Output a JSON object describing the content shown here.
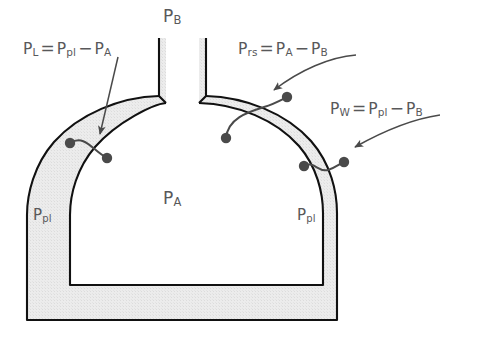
{
  "figure": {
    "title_alt": "Respiratory system pressure relationships",
    "background_color": "#ffffff",
    "shade_color": "#e7e7e7",
    "stroke_color": "#111111",
    "text_color": "#58585a",
    "leader_color": "#4a4a4a",
    "dot_color": "#4a4a4a"
  },
  "labels": {
    "barometric": {
      "id": "P-B",
      "base": "P",
      "sub": "B",
      "x": 163,
      "y": 8
    },
    "alveolar": {
      "id": "P-A",
      "base": "P",
      "sub": "A",
      "x": 163,
      "y": 190
    },
    "pleural_left": {
      "id": "P-pl-left",
      "base": "P",
      "sub": "pl",
      "x": 33,
      "y": 207
    },
    "pleural_right": {
      "id": "P-pl-right",
      "base": "P",
      "sub": "pl",
      "x": 297,
      "y": 207
    }
  },
  "equations": [
    {
      "name": "transpulmonary-pressure",
      "x": 23,
      "y": 40,
      "terms": [
        {
          "base": "P",
          "sub": "L"
        },
        {
          "op": "="
        },
        {
          "base": "P",
          "sub": "pl"
        },
        {
          "op": "−"
        },
        {
          "base": "P",
          "sub": "A"
        }
      ],
      "plain": "PL = Ppl − PA"
    },
    {
      "name": "respiratory-system-pressure",
      "x": 238,
      "y": 40,
      "terms": [
        {
          "base": "P",
          "sub": "rs"
        },
        {
          "op": "="
        },
        {
          "base": "P",
          "sub": "A"
        },
        {
          "op": "−"
        },
        {
          "base": "P",
          "sub": "B"
        }
      ],
      "plain": "Prs = PA − PB"
    },
    {
      "name": "chest-wall-pressure",
      "x": 330,
      "y": 100,
      "terms": [
        {
          "base": "P",
          "sub": "W"
        },
        {
          "op": "="
        },
        {
          "base": "P",
          "sub": "pl"
        },
        {
          "op": "−"
        },
        {
          "base": "P",
          "sub": "B"
        }
      ],
      "plain": "PW = Ppl − PB"
    }
  ],
  "measurement_pairs": [
    {
      "name": "transpulmonary-probe",
      "dot_a": {
        "x": 70,
        "y": 143
      },
      "dot_b": {
        "x": 107,
        "y": 158
      },
      "radius": 5.2
    },
    {
      "name": "respiratory-system-probe",
      "dot_a": {
        "x": 226,
        "y": 138
      },
      "dot_b": {
        "x": 287,
        "y": 97
      },
      "radius": 5.2
    },
    {
      "name": "chest-wall-probe",
      "dot_a": {
        "x": 304,
        "y": 166
      },
      "dot_b": {
        "x": 344,
        "y": 162
      },
      "radius": 5.2
    }
  ],
  "arrow_leaders": [
    {
      "name": "leader-to-transpulmonary",
      "from": {
        "x": 117,
        "y": 57
      },
      "to": {
        "x": 99,
        "y": 138
      }
    },
    {
      "name": "leader-to-respiratory-system",
      "from": {
        "x": 322,
        "y": 57
      },
      "to": {
        "x": 270,
        "y": 94
      }
    },
    {
      "name": "leader-to-chest-wall",
      "from": {
        "x": 425,
        "y": 117
      },
      "to": {
        "x": 350,
        "y": 150
      }
    }
  ]
}
